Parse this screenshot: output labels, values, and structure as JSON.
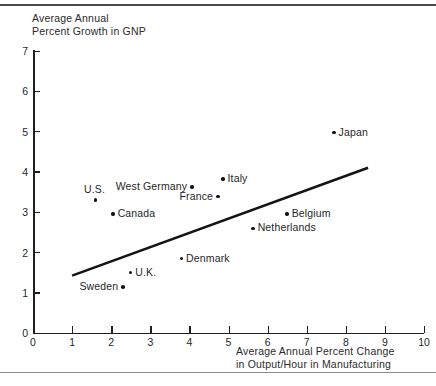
{
  "chart_data": {
    "type": "scatter",
    "title": "",
    "ylabel": "Average Annual\nPercent Growth in GNP",
    "xlabel": "Average Annual Percent Change\nin Output/Hour in Manufacturing",
    "xlim": [
      0,
      10
    ],
    "ylim": [
      0,
      7
    ],
    "xticks": [
      0,
      1,
      2,
      3,
      4,
      5,
      6,
      7,
      8,
      9,
      10
    ],
    "yticks": [
      0,
      1,
      2,
      3,
      4,
      5,
      6,
      7
    ],
    "grid": false,
    "legend": "none",
    "points": [
      {
        "label": "U.S.",
        "x": 1.6,
        "y": 3.3,
        "label_pos": "above-left"
      },
      {
        "label": "Canada",
        "x": 2.05,
        "y": 2.95,
        "label_pos": "right"
      },
      {
        "label": "Sweden",
        "x": 2.3,
        "y": 1.15,
        "label_pos": "left"
      },
      {
        "label": "U.K.",
        "x": 2.5,
        "y": 1.5,
        "label_pos": "right"
      },
      {
        "label": "Denmark",
        "x": 3.8,
        "y": 1.85,
        "label_pos": "right"
      },
      {
        "label": "West Germany",
        "x": 4.07,
        "y": 3.62,
        "label_pos": "left"
      },
      {
        "label": "France",
        "x": 4.73,
        "y": 3.38,
        "label_pos": "left"
      },
      {
        "label": "Italy",
        "x": 4.86,
        "y": 3.82,
        "label_pos": "right"
      },
      {
        "label": "Netherlands",
        "x": 5.63,
        "y": 2.6,
        "label_pos": "right"
      },
      {
        "label": "Belgium",
        "x": 6.5,
        "y": 2.95,
        "label_pos": "right"
      },
      {
        "label": "Japan",
        "x": 7.7,
        "y": 4.97,
        "label_pos": "right"
      }
    ],
    "trend_line": {
      "x0": 1.0,
      "y0": 1.43,
      "x1": 8.57,
      "y1": 4.1,
      "color": "#141414"
    }
  },
  "axes": {
    "y_tick_labels": [
      "0",
      "1",
      "2",
      "3",
      "4",
      "5",
      "6",
      "7"
    ],
    "x_tick_labels": [
      "0",
      "1",
      "2",
      "3",
      "4",
      "5",
      "6",
      "7",
      "8",
      "9",
      "10"
    ],
    "y_title_line1": "Average Annual",
    "y_title_line2": "Percent Growth in GNP",
    "x_title_line1": "Average Annual Percent Change",
    "x_title_line2": "in Output/Hour in Manufacturing"
  },
  "source_note": ""
}
